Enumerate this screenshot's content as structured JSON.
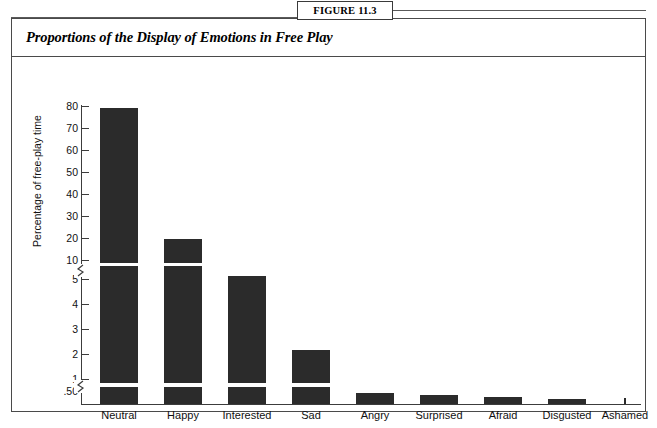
{
  "figure": {
    "tab_label": "FIGURE 11.3",
    "title": "Proportions of the Display of Emotions in Free Play"
  },
  "chart_data": {
    "type": "bar",
    "title": "Proportions of the Display of Emotions in Free Play",
    "xlabel": "",
    "ylabel": "Percentage of free-play time",
    "categories": [
      "Neutral",
      "Happy",
      "Interested",
      "Sad",
      "Angry",
      "Surprised",
      "Afraid",
      "Disgusted",
      "Ashamed"
    ],
    "values": [
      78.0,
      18.0,
      5.3,
      2.1,
      0.42,
      0.36,
      0.3,
      0.24,
      0.02
    ],
    "ytick_labels": [
      "80",
      "70",
      "60",
      "50",
      "40",
      "30",
      "20",
      "10",
      "5",
      "4",
      "3",
      "2",
      "1",
      ".50"
    ],
    "axis_type": "broken-log-segments",
    "axis_breaks": [
      "between 10 and 5",
      "between 1 and .50"
    ],
    "grid": false,
    "legend": false,
    "bar_color": "#2b2b2b"
  },
  "axis": {
    "ticks": [
      {
        "label": "80",
        "y": 49
      },
      {
        "label": "70",
        "y": 71
      },
      {
        "label": "60",
        "y": 93
      },
      {
        "label": "50",
        "y": 115
      },
      {
        "label": "40",
        "y": 137
      },
      {
        "label": "30",
        "y": 159
      },
      {
        "label": "20",
        "y": 181
      },
      {
        "label": "10",
        "y": 203
      },
      {
        "label": "5",
        "y": 222
      },
      {
        "label": "4",
        "y": 247
      },
      {
        "label": "3",
        "y": 272
      },
      {
        "label": "2",
        "y": 297
      },
      {
        "label": "1",
        "y": 322
      },
      {
        "label": ".50",
        "y": 334
      }
    ],
    "breaks": [
      {
        "y": 212
      },
      {
        "y": 328
      }
    ]
  },
  "bars": [
    {
      "name": "Neutral",
      "x": 88,
      "width": 38,
      "label_center": 107,
      "segments": [
        {
          "top": 51,
          "height": 155
        },
        {
          "top": 209,
          "height": 117
        },
        {
          "top": 330,
          "height": 17
        }
      ]
    },
    {
      "name": "Happy",
      "x": 152,
      "width": 38,
      "label_center": 171,
      "segments": [
        {
          "top": 182,
          "height": 24
        },
        {
          "top": 209,
          "height": 117
        },
        {
          "top": 330,
          "height": 17
        }
      ]
    },
    {
      "name": "Interested",
      "x": 216,
      "width": 38,
      "label_center": 235,
      "segments": [
        {
          "top": 219,
          "height": 107
        },
        {
          "top": 330,
          "height": 17
        }
      ]
    },
    {
      "name": "Sad",
      "x": 280,
      "width": 38,
      "label_center": 299,
      "segments": [
        {
          "top": 293,
          "height": 33
        },
        {
          "top": 330,
          "height": 17
        }
      ]
    },
    {
      "name": "Angry",
      "x": 344,
      "width": 38,
      "label_center": 363,
      "segments": [
        {
          "top": 336,
          "height": 11
        }
      ]
    },
    {
      "name": "Surprised",
      "x": 408,
      "width": 38,
      "label_center": 427,
      "segments": [
        {
          "top": 338,
          "height": 9
        }
      ]
    },
    {
      "name": "Afraid",
      "x": 472,
      "width": 38,
      "label_center": 491,
      "segments": [
        {
          "top": 340,
          "height": 7
        }
      ]
    },
    {
      "name": "Disgusted",
      "x": 536,
      "width": 38,
      "label_center": 555,
      "segments": [
        {
          "top": 342,
          "height": 5
        }
      ]
    },
    {
      "name": "Ashamed",
      "x": 612,
      "width": 2,
      "label_center": 613,
      "segments": [
        {
          "top": 341,
          "height": 6
        }
      ]
    }
  ]
}
